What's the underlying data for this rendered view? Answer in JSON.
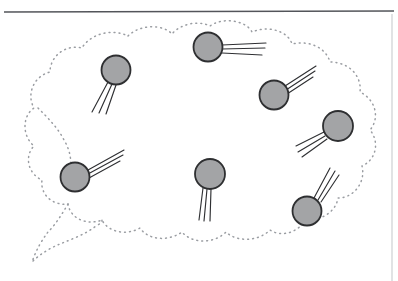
{
  "figure": {
    "title": "",
    "canvas": {
      "width": 398,
      "height": 281,
      "background": "#ffffff"
    },
    "colors": {
      "page_background": "#ffffff",
      "header_rule": "#53555a",
      "right_border": "#c9cbce",
      "cloud_dots": "#9a9da2",
      "particle_fill": "#a3a4a6",
      "particle_stroke": "#2e2f31",
      "trace_stroke": "#2f3033"
    },
    "header_rule": {
      "name": "horizontal-rule",
      "x1": 4,
      "y1": 12,
      "x2": 394,
      "y2": 11,
      "stroke_width": 1.6
    },
    "right_border": {
      "name": "right-vertical-border",
      "x1": 392,
      "y1": 14,
      "x2": 392,
      "y2": 281,
      "stroke_width": 1.1
    },
    "cloud": {
      "name": "dotted-cloud-region",
      "stroke_width": 1.5,
      "dash_pattern": "0.9 4.1",
      "outer_path": "M 128 36 C 140 24 163 24 172 34 C 180 24 198 20 210 26 C 222 17 246 20 252 32 C 268 25 288 31 292 44 C 310 40 326 48 330 62 C 349 62 362 76 360 92 C 376 100 380 118 370 130 C 380 142 376 160 362 166 C 366 182 354 198 338 198 C 336 212 320 222 306 218 C 300 232 282 238 270 230 C 258 242 236 242 226 232 C 214 244 192 244 182 232 C 168 242 148 240 140 228 C 126 236 108 232 102 220 C 86 226 70 218 68 204 C 52 206 40 194 42 180 C 28 174 24 156 34 146 C 22 136 22 116 34 108 C 26 94 34 76 50 72 C 50 56 66 44 82 48 C 90 34 112 28 128 36 Z",
      "tail_path": "M 68 204 C 62 214 56 224 48 232 C 42 240 36 250 32 262 C 40 254 50 248 60 244 C 72 239 86 234 96 226 C 100 224 102 222 102 220",
      "inner_arc_path": "M 38 108 C 48 118 58 128 64 140 C 70 150 72 160 70 172"
    },
    "particles": [
      {
        "id": "particle-1",
        "label": "top-left-particle",
        "cx": 116,
        "cy": 70,
        "r": 14.5,
        "trace_angle_deg": 243,
        "trace_lines": [
          {
            "x1": 108,
            "y1": 82,
            "x2": 92,
            "y2": 112
          },
          {
            "x1": 112,
            "y1": 84,
            "x2": 99,
            "y2": 113
          },
          {
            "x1": 116,
            "y1": 85,
            "x2": 106,
            "y2": 114
          }
        ]
      },
      {
        "id": "particle-2",
        "label": "top-center-particle",
        "cx": 208,
        "cy": 47,
        "r": 14.5,
        "trace_angle_deg": 5,
        "trace_lines": [
          {
            "x1": 222,
            "y1": 45,
            "x2": 266,
            "y2": 43
          },
          {
            "x1": 222,
            "y1": 49,
            "x2": 265,
            "y2": 48
          },
          {
            "x1": 222,
            "y1": 53,
            "x2": 262,
            "y2": 55
          }
        ]
      },
      {
        "id": "particle-3",
        "label": "upper-right-particle",
        "cx": 274,
        "cy": 95,
        "r": 14.5,
        "trace_angle_deg": 325,
        "trace_lines": [
          {
            "x1": 285,
            "y1": 86,
            "x2": 316,
            "y2": 66
          },
          {
            "x1": 286,
            "y1": 90,
            "x2": 315,
            "y2": 71
          },
          {
            "x1": 287,
            "y1": 94,
            "x2": 313,
            "y2": 77
          }
        ]
      },
      {
        "id": "particle-4",
        "label": "right-particle",
        "cx": 338,
        "cy": 126,
        "r": 15,
        "trace_angle_deg": 205,
        "trace_lines": [
          {
            "x1": 324,
            "y1": 132,
            "x2": 296,
            "y2": 146
          },
          {
            "x1": 325,
            "y1": 136,
            "x2": 298,
            "y2": 152
          },
          {
            "x1": 327,
            "y1": 139,
            "x2": 302,
            "y2": 157
          }
        ]
      },
      {
        "id": "particle-5",
        "label": "left-particle",
        "cx": 75,
        "cy": 177,
        "r": 14.5,
        "trace_angle_deg": 332,
        "trace_lines": [
          {
            "x1": 88,
            "y1": 170,
            "x2": 124,
            "y2": 150
          },
          {
            "x1": 88,
            "y1": 174,
            "x2": 123,
            "y2": 155
          },
          {
            "x1": 89,
            "y1": 178,
            "x2": 120,
            "y2": 161
          }
        ]
      },
      {
        "id": "particle-6",
        "label": "center-particle",
        "cx": 210,
        "cy": 174,
        "r": 15,
        "trace_angle_deg": 96,
        "trace_lines": [
          {
            "x1": 203,
            "y1": 188,
            "x2": 199,
            "y2": 220
          },
          {
            "x1": 207,
            "y1": 189,
            "x2": 204,
            "y2": 221
          },
          {
            "x1": 211,
            "y1": 189,
            "x2": 210,
            "y2": 221
          }
        ]
      },
      {
        "id": "particle-7",
        "label": "bottom-right-particle",
        "cx": 307,
        "cy": 211,
        "r": 14.5,
        "trace_angle_deg": 303,
        "trace_lines": [
          {
            "x1": 314,
            "y1": 198,
            "x2": 330,
            "y2": 168
          },
          {
            "x1": 318,
            "y1": 200,
            "x2": 335,
            "y2": 171
          },
          {
            "x1": 321,
            "y1": 202,
            "x2": 339,
            "y2": 175
          }
        ]
      }
    ],
    "particle_count": 7,
    "traces_per_particle": 3
  }
}
